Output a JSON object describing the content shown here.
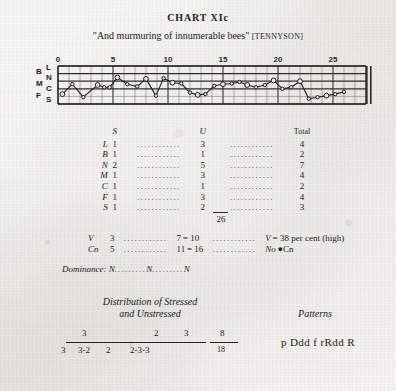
{
  "header": {
    "chart_label": "CHART XIc",
    "quote": "\"And murmuring of innumerable bees\"",
    "source": "[TENNYSON]"
  },
  "chart_data": {
    "type": "line",
    "title": "CHART XIc",
    "subtitle": "\"And murmuring of innumerable bees\" [TENNYSON]",
    "xlabel": "",
    "ylabel": "",
    "x_ticks": [
      "0",
      "5",
      "10",
      "15",
      "20",
      "25"
    ],
    "x_tick_values": [
      0,
      5,
      10,
      15,
      20,
      25
    ],
    "xlim": [
      0,
      28
    ],
    "y_categories_left": [
      "B",
      "M",
      "F"
    ],
    "y_categories_right": [
      "L",
      "N",
      "C",
      "S"
    ],
    "ylim": [
      0,
      5
    ],
    "grid": true,
    "legend": "none",
    "end_marker": "double-bar",
    "series": [
      {
        "name": "pitch-contour",
        "x": [
          0.4,
          1.3,
          2.3,
          3.6,
          4.2,
          4.7,
          5.4,
          6.3,
          7.2,
          8.0,
          8.9,
          9.6,
          10.4,
          11.2,
          12.0,
          12.7,
          13.4,
          14.2,
          15.0,
          15.8,
          16.5,
          17.2,
          18.0,
          18.8,
          19.6,
          20.4,
          21.2,
          22.0,
          22.8,
          23.6,
          24.4,
          25.2,
          26.0
        ],
        "y": [
          1.3,
          2.6,
          0.9,
          2.5,
          2.2,
          2.2,
          3.5,
          2.6,
          2.3,
          3.3,
          1.1,
          3.4,
          2.8,
          2.7,
          1.5,
          1.2,
          1.3,
          2.4,
          2.6,
          2.7,
          2.9,
          2.5,
          2.2,
          2.5,
          3.1,
          2.0,
          2.2,
          3.0,
          0.7,
          0.9,
          1.1,
          1.3,
          1.6
        ]
      }
    ]
  },
  "table": {
    "columns": [
      "",
      "S",
      "U",
      "Total"
    ],
    "rows": [
      {
        "label": "L",
        "s": "1",
        "u": "3",
        "total": "4"
      },
      {
        "label": "B",
        "s": "1",
        "u": "1",
        "total": "2"
      },
      {
        "label": "N",
        "s": "2",
        "u": "5",
        "total": "7"
      },
      {
        "label": "M",
        "s": "1",
        "u": "3",
        "total": "4"
      },
      {
        "label": "C",
        "s": "1",
        "u": "1",
        "total": "2"
      },
      {
        "label": "F",
        "s": "1",
        "u": "3",
        "total": "4"
      },
      {
        "label": "S",
        "s": "1",
        "u": "2",
        "total": "3"
      }
    ],
    "sum": "26",
    "dots": "............"
  },
  "ratios": {
    "rows": [
      {
        "label": "V",
        "a": "3",
        "b": "7",
        "eq": "= 10",
        "note_prefix": "V",
        "note": "= 38 per cent (high)"
      },
      {
        "label": "Cn",
        "a": "5",
        "b": "11",
        "eq": "= 16",
        "note_prefix": "No",
        "note": "●Cn"
      }
    ],
    "dominance_label": "Dominance:",
    "dominance_values": [
      "N",
      "N",
      "N"
    ],
    "dots": "............"
  },
  "distribution": {
    "title_line1": "Distribution of Stressed",
    "title_line2": "and Unstressed",
    "numerators": [
      "3",
      "2",
      "3"
    ],
    "denominators": [
      "3",
      "3‑2",
      "2",
      "2‑3‑3"
    ],
    "fraction_num": "8",
    "fraction_den": "18"
  },
  "patterns": {
    "title": "Patterns",
    "value": "p Ddd f rRdd R"
  }
}
